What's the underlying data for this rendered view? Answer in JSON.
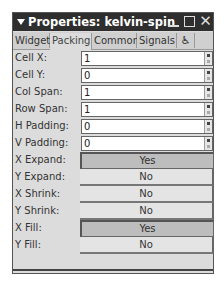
{
  "window": {
    "title": "Properties: kelvin-spin",
    "controls": {
      "minimize": "_",
      "maximize": "□",
      "close": "✕"
    }
  },
  "tabs": [
    {
      "label": "Widget",
      "active": false
    },
    {
      "label": "Packing",
      "active": true
    },
    {
      "label": "Common",
      "active": false
    },
    {
      "label": "Signals",
      "active": false
    },
    {
      "label": "♿",
      "icon": "accessibility-icon",
      "active": false
    }
  ],
  "spin_rows": [
    {
      "label": "Cell X:",
      "value": "1"
    },
    {
      "label": "Cell Y:",
      "value": "0"
    },
    {
      "label": "Col Span:",
      "value": "1"
    },
    {
      "label": "Row Span:",
      "value": "1"
    },
    {
      "label": "H Padding:",
      "value": "0"
    },
    {
      "label": "V Padding:",
      "value": "0"
    }
  ],
  "toggle_rows": [
    {
      "label": "X Expand:",
      "value": "Yes",
      "active": true
    },
    {
      "label": "Y Expand:",
      "value": "No",
      "active": false
    },
    {
      "label": "X Shrink:",
      "value": "No",
      "active": false
    },
    {
      "label": "Y Shrink:",
      "value": "No",
      "active": false
    },
    {
      "label": "X Fill:",
      "value": "Yes",
      "active": true
    },
    {
      "label": "Y Fill:",
      "value": "No",
      "active": false
    }
  ]
}
